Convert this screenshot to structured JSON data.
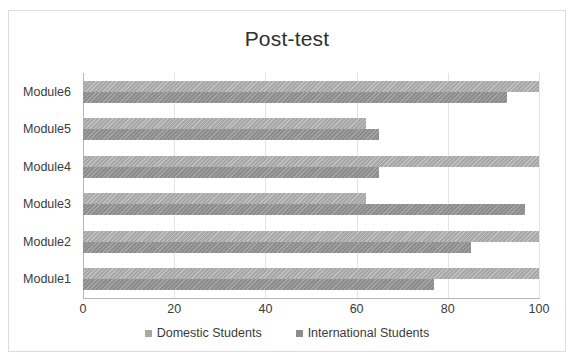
{
  "chart_data": {
    "type": "bar",
    "orientation": "horizontal",
    "title": "Post-test",
    "xlabel": "",
    "ylabel": "",
    "xlim": [
      0,
      100
    ],
    "xticks": [
      0,
      20,
      40,
      60,
      80,
      100
    ],
    "categories": [
      "Module1",
      "Module2",
      "Module3",
      "Module4",
      "Module5",
      "Module6"
    ],
    "grid": true,
    "legend_position": "bottom",
    "series": [
      {
        "name": "Domestic Students",
        "color": "#a8a8a8",
        "values": [
          100,
          100,
          62,
          100,
          62,
          100
        ]
      },
      {
        "name": "International Students",
        "color": "#8d8d8d",
        "values": [
          77,
          85,
          97,
          65,
          65,
          93
        ]
      }
    ]
  },
  "figure": {
    "border_color": "#dcdcdc",
    "background": "#ffffff"
  }
}
